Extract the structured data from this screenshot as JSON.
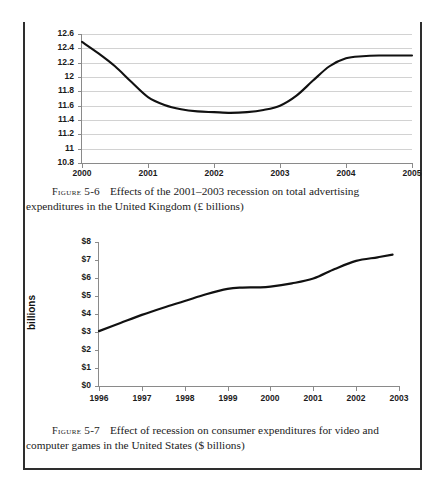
{
  "page": {
    "kind": "scanned-textbook-page",
    "figures": [
      {
        "id": "figure-5-6",
        "label_word": "Figure",
        "number": "5-6",
        "caption_line1": "Effects of the 2001–2003 recession on total advertising",
        "caption_line2": "expenditures in the United Kingdom (£ billions)"
      },
      {
        "id": "figure-5-7",
        "label_word": "Figure",
        "number": "5-7",
        "caption_line1": "Effect of recession on consumer expenditures for video and",
        "caption_line2": "computer games in the United States ($ billions)"
      }
    ]
  },
  "chart_data": [
    {
      "type": "line",
      "id": "uk-advertising-expenditure",
      "title": "",
      "xlabel": "",
      "ylabel": "",
      "ylim": [
        10.8,
        12.6
      ],
      "ytick_step": 0.2,
      "ytick_labels": [
        "12.6",
        "12.4",
        "12.2",
        "12",
        "11.8",
        "11.6",
        "11.4",
        "11.2",
        "11",
        "10.8"
      ],
      "ytick_values": [
        12.6,
        12.4,
        12.2,
        12.0,
        11.8,
        11.6,
        11.4,
        11.2,
        11.0,
        10.8
      ],
      "categories": [
        "2000",
        "2001",
        "2002",
        "2003",
        "2004",
        "2005"
      ],
      "x": [
        2000,
        2001,
        2002,
        2003,
        2004,
        2005
      ],
      "values": [
        12.49,
        11.72,
        11.52,
        11.54,
        12.27,
        12.3
      ],
      "smoothed_points": [
        [
          2000.0,
          12.49
        ],
        [
          2000.25,
          12.33
        ],
        [
          2000.5,
          12.15
        ],
        [
          2000.75,
          11.93
        ],
        [
          2001.0,
          11.72
        ],
        [
          2001.25,
          11.61
        ],
        [
          2001.5,
          11.55
        ],
        [
          2001.75,
          11.52
        ],
        [
          2002.0,
          11.51
        ],
        [
          2002.25,
          11.5
        ],
        [
          2002.5,
          11.51
        ],
        [
          2002.75,
          11.54
        ],
        [
          2003.0,
          11.6
        ],
        [
          2003.25,
          11.74
        ],
        [
          2003.5,
          11.95
        ],
        [
          2003.75,
          12.15
        ],
        [
          2004.0,
          12.26
        ],
        [
          2004.25,
          12.29
        ],
        [
          2004.5,
          12.3
        ],
        [
          2005.0,
          12.3
        ]
      ],
      "grid": true,
      "legend": "none",
      "line_color": "#111111",
      "grid_color": "#d2d2d2",
      "axis_color": "#8a8a8a"
    },
    {
      "type": "line",
      "id": "us-video-game-expenditure",
      "title": "",
      "xlabel": "",
      "ylabel": "billions",
      "ylim": [
        0,
        8
      ],
      "ytick_step": 1,
      "ytick_labels": [
        "$8",
        "$7",
        "$6",
        "$5",
        "$4",
        "$3",
        "$2",
        "$1",
        "$0"
      ],
      "ytick_values": [
        8,
        7,
        6,
        5,
        4,
        3,
        2,
        1,
        0
      ],
      "categories": [
        "1996",
        "1997",
        "1998",
        "1999",
        "2000",
        "2001",
        "2002",
        "2003"
      ],
      "x": [
        1996,
        1997,
        1998,
        1999,
        2000,
        2001,
        2002,
        2003
      ],
      "values": [
        3.05,
        3.95,
        4.7,
        5.4,
        5.5,
        5.95,
        6.95,
        7.3
      ],
      "smoothed_points": [
        [
          1996.0,
          3.05
        ],
        [
          1996.5,
          3.5
        ],
        [
          1997.0,
          3.95
        ],
        [
          1997.5,
          4.35
        ],
        [
          1998.0,
          4.72
        ],
        [
          1998.5,
          5.1
        ],
        [
          1999.0,
          5.4
        ],
        [
          1999.35,
          5.47
        ],
        [
          1999.7,
          5.48
        ],
        [
          2000.0,
          5.52
        ],
        [
          2000.5,
          5.7
        ],
        [
          2001.0,
          5.97
        ],
        [
          2001.5,
          6.5
        ],
        [
          2002.0,
          6.95
        ],
        [
          2002.5,
          7.15
        ],
        [
          2002.85,
          7.3
        ]
      ],
      "grid": false,
      "legend": "none",
      "line_color": "#111111",
      "grid_color": "#d2d2d2",
      "axis_color": "#8a8a8a"
    }
  ]
}
